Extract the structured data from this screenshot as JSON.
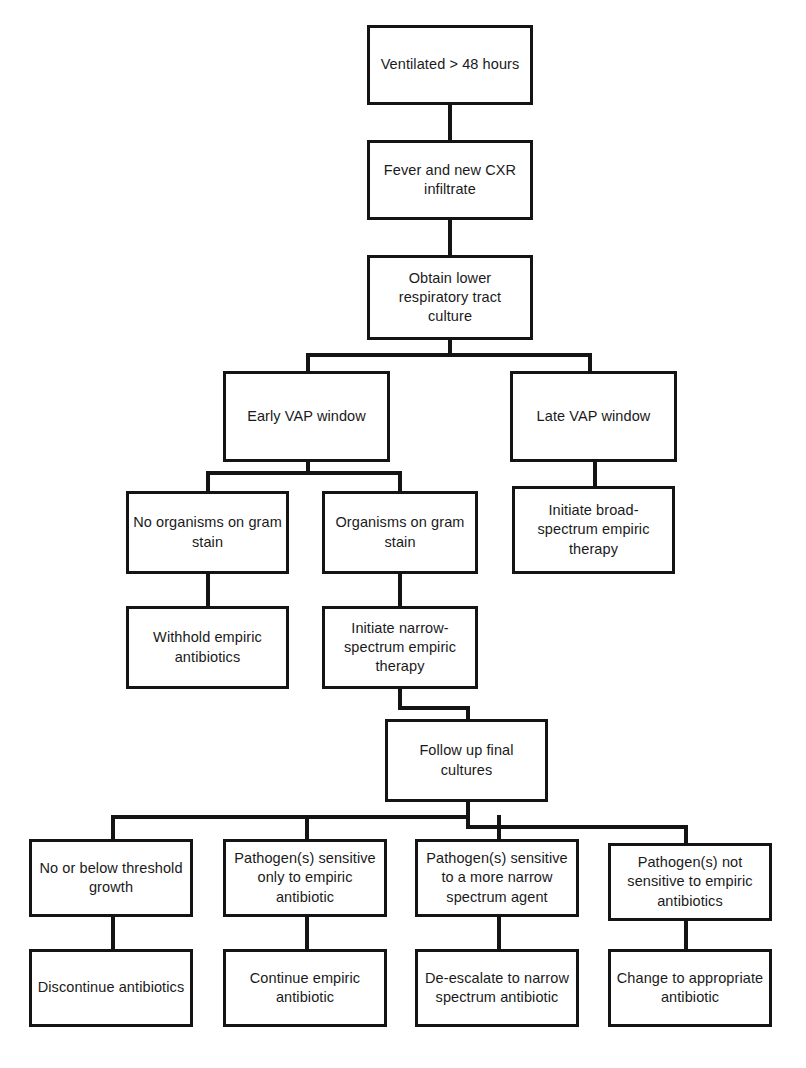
{
  "diagram": {
    "type": "flowchart",
    "orientation": "top-down",
    "line_color": "#141414",
    "box_fill": "#ffffff",
    "text_color": "#1a1a1a"
  },
  "nodes": {
    "ventilated": {
      "label": "Ventilated > 48 hours"
    },
    "fever_cxr": {
      "label": "Fever and new CXR\ninfiltrate"
    },
    "obtain_culture": {
      "label": "Obtain lower\nrespiratory tract\nculture"
    },
    "early_vap": {
      "label": "Early VAP window"
    },
    "late_vap": {
      "label": "Late VAP window"
    },
    "no_organisms": {
      "label": "No organisms on gram\nstain"
    },
    "organisms": {
      "label": "Organisms on gram\nstain"
    },
    "broad_spectrum": {
      "label": "Initiate broad-\nspectrum empiric\ntherapy"
    },
    "withhold": {
      "label": "Withhold empiric\nantibiotics"
    },
    "narrow_spectrum": {
      "label": "Initiate narrow-\nspectrum empiric\ntherapy"
    },
    "follow_up": {
      "label": "Follow up final\ncultures"
    },
    "below_threshold": {
      "label": "No or below threshold\ngrowth"
    },
    "sensitive_empiric_only": {
      "label": "Pathogen(s) sensitive\nonly to empiric\nantibiotic"
    },
    "sensitive_narrow": {
      "label": "Pathogen(s) sensitive\nto a more narrow\nspectrum agent"
    },
    "not_sensitive": {
      "label": "Pathogen(s) not\nsensitive to empiric\nantibiotics"
    },
    "discontinue": {
      "label": "Discontinue antibiotics"
    },
    "continue_empiric": {
      "label": "Continue empiric\nantibiotic"
    },
    "de_escalate": {
      "label": "De-escalate to narrow\nspectrum antibiotic"
    },
    "change_appropriate": {
      "label": "Change to appropriate\nantibiotic"
    }
  },
  "edges": [
    {
      "from": "ventilated",
      "to": "fever_cxr"
    },
    {
      "from": "fever_cxr",
      "to": "obtain_culture"
    },
    {
      "from": "obtain_culture",
      "to": "early_vap"
    },
    {
      "from": "obtain_culture",
      "to": "late_vap"
    },
    {
      "from": "early_vap",
      "to": "no_organisms"
    },
    {
      "from": "early_vap",
      "to": "organisms"
    },
    {
      "from": "late_vap",
      "to": "broad_spectrum"
    },
    {
      "from": "no_organisms",
      "to": "withhold"
    },
    {
      "from": "organisms",
      "to": "narrow_spectrum"
    },
    {
      "from": "narrow_spectrum",
      "to": "follow_up"
    },
    {
      "from": "follow_up",
      "to": "below_threshold"
    },
    {
      "from": "follow_up",
      "to": "sensitive_empiric_only"
    },
    {
      "from": "follow_up",
      "to": "sensitive_narrow"
    },
    {
      "from": "follow_up",
      "to": "not_sensitive"
    },
    {
      "from": "below_threshold",
      "to": "discontinue"
    },
    {
      "from": "sensitive_empiric_only",
      "to": "continue_empiric"
    },
    {
      "from": "sensitive_narrow",
      "to": "de_escalate"
    },
    {
      "from": "not_sensitive",
      "to": "change_appropriate"
    }
  ]
}
